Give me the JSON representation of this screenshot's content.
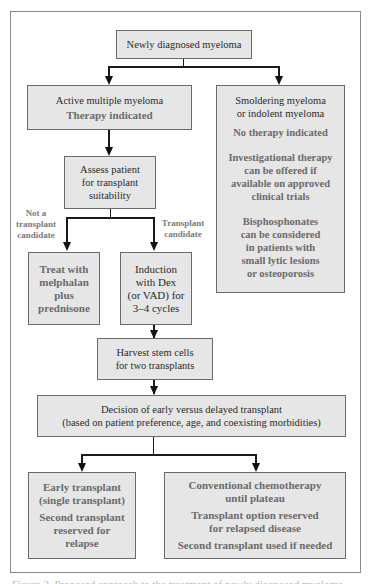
{
  "diagram": {
    "nodes": {
      "start": {
        "lines": [
          "Newly diagnosed myeloma"
        ]
      },
      "active": {
        "title": "Active multiple myeloma",
        "subtitle": "Therapy indicated"
      },
      "smoldering": {
        "title_lines": [
          "Smoldering myeloma",
          "or indolent myeloma"
        ],
        "notes": [
          [
            "No therapy indicated"
          ],
          [
            "Investigational therapy",
            "can be offered if",
            "available on approved",
            "clinical trials"
          ],
          [
            "Bisphosphonates",
            "can be considered",
            "in patients with",
            "small lytic lesions",
            "or osteoporosis"
          ]
        ]
      },
      "assess": {
        "lines": [
          "Assess patient",
          "for transplant",
          "suitability"
        ]
      },
      "melphalan": {
        "lines": [
          "Treat with",
          "melphalan",
          "plus",
          "prednisone"
        ]
      },
      "induction": {
        "lines": [
          "Induction",
          "with Dex",
          "(or VAD) for",
          "3–4 cycles"
        ]
      },
      "harvest": {
        "lines": [
          "Harvest stem cells",
          "for two transplants"
        ]
      },
      "decision": {
        "lines": [
          "Decision of early versus delayed transplant",
          "(based on patient preference, age, and coexisting morbidities)"
        ]
      },
      "early": {
        "title_lines": [
          "Early transplant",
          "(single transplant)"
        ],
        "note_lines": [
          "Second transplant",
          "reserved for",
          "relapse"
        ]
      },
      "conventional": {
        "groups": [
          [
            "Conventional chemotherapy",
            "until plateau"
          ],
          [
            "Transplant option reserved",
            "for relapsed disease"
          ],
          [
            "Second transplant used if needed"
          ]
        ]
      }
    },
    "edge_labels": {
      "not_candidate": [
        "Not a",
        "transplant",
        "candidate"
      ],
      "candidate": [
        "Transplant",
        "candidate"
      ]
    },
    "caption": "Figure 2. Proposed approach to the treatment of newly diagnosed myeloma"
  }
}
